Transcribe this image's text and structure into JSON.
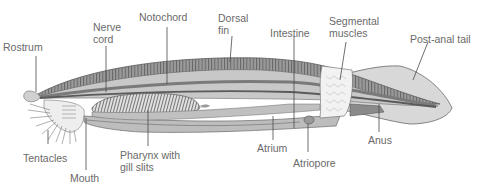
{
  "diagram": {
    "colors": {
      "body_fill": "#d6d6d6",
      "body_dark": "#8c8c8c",
      "dorsal_band": "#a8a8a8",
      "outline": "#5a5a5a",
      "label_text": "#6a6a6a",
      "leader_line": "#4a4a4a",
      "muscle_block": "#f2f2f2"
    },
    "labels": [
      {
        "id": "rostrum",
        "text": "Rostrum"
      },
      {
        "id": "nerve-cord",
        "text": "Nerve\ncord"
      },
      {
        "id": "notochord",
        "text": "Notochord"
      },
      {
        "id": "dorsal-fin",
        "text": "Dorsal\nfin"
      },
      {
        "id": "intestine",
        "text": "Intestine"
      },
      {
        "id": "segmental-muscles",
        "text": "Segmental\nmuscles"
      },
      {
        "id": "post-anal-tail",
        "text": "Post-anal tail"
      },
      {
        "id": "tentacles",
        "text": "Tentacles"
      },
      {
        "id": "mouth",
        "text": "Mouth"
      },
      {
        "id": "pharynx",
        "text": "Pharynx with\ngill slits"
      },
      {
        "id": "atrium",
        "text": "Atrium"
      },
      {
        "id": "atriopore",
        "text": "Atriopore"
      },
      {
        "id": "anus",
        "text": "Anus"
      }
    ]
  }
}
